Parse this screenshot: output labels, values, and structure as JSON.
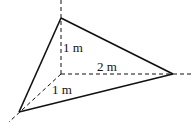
{
  "diagram": {
    "type": "3d-axes-tetrahedron",
    "colors": {
      "stroke": "#111111",
      "background": "#ffffff"
    },
    "labels": {
      "vertical": "1 m",
      "horizontal": "2 m",
      "depth": "1 m"
    },
    "points": {
      "origin": [
        61,
        74
      ],
      "top": [
        61,
        18
      ],
      "right": [
        173,
        74
      ],
      "front": [
        19,
        112
      ]
    }
  }
}
